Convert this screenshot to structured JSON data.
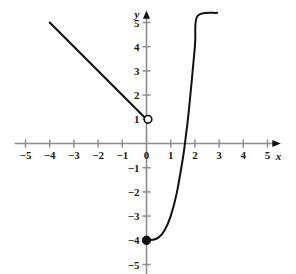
{
  "chart_data": {
    "type": "line",
    "title": "",
    "subtitle": "",
    "xlabel": "x",
    "ylabel": "y",
    "xlim": [
      -5.6,
      5.6
    ],
    "ylim": [
      -5.6,
      5.6
    ],
    "grid": false,
    "legend": "none",
    "x_ticks": [
      -5,
      -4,
      -3,
      -2,
      -1,
      0,
      1,
      2,
      3,
      4,
      5
    ],
    "y_ticks": [
      -5,
      -4,
      -3,
      -2,
      -1,
      1,
      2,
      3,
      4,
      5
    ],
    "x_tick_labels": [
      "−5",
      "−4",
      "−3",
      "−2",
      "−1",
      "0",
      "1",
      "2",
      "3",
      "4",
      "5"
    ],
    "y_tick_labels": [
      "−5",
      "−4",
      "−3",
      "−2",
      "−1",
      "1",
      "2",
      "3",
      "4",
      "5"
    ],
    "origin_label": "0",
    "axis_color": "#8c8c8c",
    "curve_color": "#111111",
    "series": [
      {
        "name": "line-segment",
        "kind": "segment",
        "equation": "y = 1 - x",
        "domain": [
          -4,
          0
        ],
        "points": [
          {
            "x": -4,
            "y": 5
          },
          {
            "x": 0,
            "y": 1
          }
        ],
        "endpoint_start": "arrowless",
        "endpoint_end": "open-circle"
      },
      {
        "name": "cubic-curve",
        "kind": "curve",
        "equation": "y = x^3 - 4",
        "domain": [
          0,
          3
        ],
        "points": [
          {
            "x": 0,
            "y": -4
          },
          {
            "x": 0.25,
            "y": -3.98
          },
          {
            "x": 0.5,
            "y": -3.88
          },
          {
            "x": 0.75,
            "y": -3.58
          },
          {
            "x": 1,
            "y": -3
          },
          {
            "x": 1.25,
            "y": -2.05
          },
          {
            "x": 1.5,
            "y": -0.63
          },
          {
            "x": 1.5874,
            "y": 0
          },
          {
            "x": 1.75,
            "y": 1.36
          },
          {
            "x": 2,
            "y": 4
          },
          {
            "x": 2.1,
            "y": 5.26
          },
          {
            "x": 2.92,
            "y": 5.4
          }
        ],
        "endpoint_start": "filled-dot",
        "endpoint_end": "open"
      }
    ],
    "markers": [
      {
        "name": "open-circle-at-0-1",
        "x": 0,
        "y": 1,
        "style": "open"
      },
      {
        "name": "filled-dot-at-0-minus-4",
        "x": 0,
        "y": -4,
        "style": "filled"
      }
    ],
    "x_axis_arrow": true,
    "y_axis_arrow": true
  }
}
